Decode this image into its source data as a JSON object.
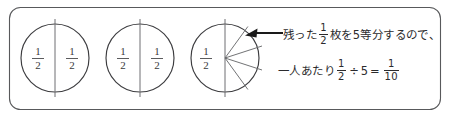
{
  "figure": {
    "kind": "math-diagram",
    "caption_lines": [
      "残った 1/2 枚を5等分するので、",
      "一人あたり 1/2 ÷ 5 = 1/10"
    ]
  },
  "colors": {
    "frame_stroke": "#58595b",
    "circle_stroke": "#3c3c3f",
    "divider_stroke": "#6e6f72",
    "sector_stroke": "#6a6b6e",
    "arrow": "#1a1a1a",
    "text": "#2b2b2d",
    "background": "#ffffff"
  },
  "circles": [
    {
      "id": "circle-1",
      "left_label": {
        "numerator": "1",
        "denominator": "2"
      },
      "right_label": {
        "numerator": "1",
        "denominator": "2"
      },
      "divided_sectors": 0
    },
    {
      "id": "circle-2",
      "left_label": {
        "numerator": "1",
        "denominator": "2"
      },
      "right_label": {
        "numerator": "1",
        "denominator": "2"
      },
      "divided_sectors": 0
    },
    {
      "id": "circle-3",
      "left_label": {
        "numerator": "1",
        "denominator": "2"
      },
      "right_label": {
        "numerator": "",
        "denominator": ""
      },
      "divided_sectors": 5
    }
  ],
  "annotation": {
    "arrow_label": "arrow-to-sector",
    "line1": {
      "prefix": "残った",
      "fraction": {
        "numerator": "1",
        "denominator": "2"
      },
      "suffix": "枚を5等分するので、"
    },
    "line2": {
      "prefix": "一人あたり",
      "fraction_a": {
        "numerator": "1",
        "denominator": "2"
      },
      "operator_divide": "÷",
      "divisor": "5",
      "operator_equals": "=",
      "fraction_b": {
        "numerator": "1",
        "denominator": "10"
      }
    }
  }
}
